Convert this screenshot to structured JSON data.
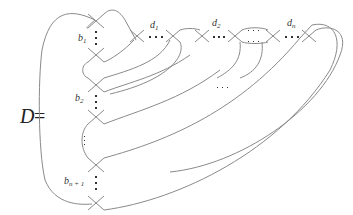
{
  "diagram": {
    "title_symbol": "D",
    "equals": "=",
    "labels": {
      "b1": "b",
      "b1_sub": "1",
      "b2": "b",
      "b2_sub": "2",
      "bn1": "b",
      "bn1_sub": "n + 1",
      "d1": "d",
      "d1_sub": "1",
      "d2": "d",
      "d2_sub": "2",
      "dn": "d",
      "dn_sub": "n"
    },
    "ellipses": [
      "⋯",
      "⋯",
      "⋯",
      "⋯"
    ],
    "stroke_color": "#8a8a8a",
    "text_color": "#333333"
  }
}
